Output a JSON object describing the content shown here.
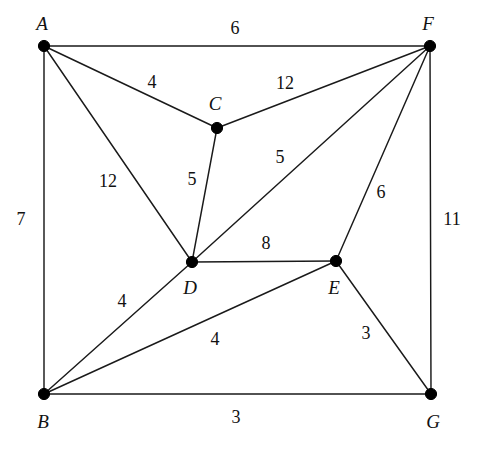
{
  "figure": {
    "type": "weighted-undirected-graph",
    "background_color": "#ffffff",
    "line_color": "#1a1a1a",
    "text_color": "#111111",
    "width": 477,
    "height": 453
  },
  "chart_data": {
    "type": "diagram",
    "title": "",
    "xlabel": "",
    "ylabel": "",
    "grid": false,
    "legend": "none",
    "nodes": [
      {
        "id": "A",
        "label": "A",
        "x": 44,
        "y": 46,
        "label_x": 42,
        "label_y": 26
      },
      {
        "id": "B",
        "label": "B",
        "x": 44,
        "y": 394,
        "label_x": 43,
        "label_y": 424
      },
      {
        "id": "C",
        "label": "C",
        "x": 217,
        "y": 128,
        "label_x": 215,
        "label_y": 106
      },
      {
        "id": "D",
        "label": "D",
        "x": 192,
        "y": 262,
        "label_x": 190,
        "label_y": 290
      },
      {
        "id": "E",
        "label": "E",
        "x": 336,
        "y": 261,
        "label_x": 334,
        "label_y": 290
      },
      {
        "id": "F",
        "label": "F",
        "x": 430,
        "y": 46,
        "label_x": 428,
        "label_y": 26
      },
      {
        "id": "G",
        "label": "G",
        "x": 431,
        "y": 394,
        "label_x": 433,
        "label_y": 424
      }
    ],
    "edges": [
      {
        "source": "A",
        "target": "F",
        "weight": 6,
        "label": "6",
        "label_x": 235,
        "label_y": 30
      },
      {
        "source": "A",
        "target": "C",
        "weight": 4,
        "label": "4",
        "label_x": 152,
        "label_y": 84
      },
      {
        "source": "A",
        "target": "D",
        "weight": 12,
        "label": "12",
        "label_x": 108,
        "label_y": 183
      },
      {
        "source": "A",
        "target": "B",
        "weight": 7,
        "label": "7",
        "label_x": 21,
        "label_y": 221
      },
      {
        "source": "C",
        "target": "F",
        "weight": 12,
        "label": "12",
        "label_x": 285,
        "label_y": 85
      },
      {
        "source": "C",
        "target": "D",
        "weight": 5,
        "label": "5",
        "label_x": 192,
        "label_y": 181
      },
      {
        "source": "D",
        "target": "F",
        "weight": 5,
        "label": "5",
        "label_x": 280,
        "label_y": 159
      },
      {
        "source": "D",
        "target": "E",
        "weight": 8,
        "label": "8",
        "label_x": 266,
        "label_y": 245
      },
      {
        "source": "D",
        "target": "B",
        "weight": 4,
        "label": "4",
        "label_x": 122,
        "label_y": 303
      },
      {
        "source": "E",
        "target": "F",
        "weight": 6,
        "label": "6",
        "label_x": 381,
        "label_y": 194
      },
      {
        "source": "E",
        "target": "B",
        "weight": 4,
        "label": "4",
        "label_x": 215,
        "label_y": 341
      },
      {
        "source": "E",
        "target": "G",
        "weight": 3,
        "label": "3",
        "label_x": 366,
        "label_y": 335
      },
      {
        "source": "F",
        "target": "G",
        "weight": 11,
        "label": "11",
        "label_x": 452,
        "label_y": 221
      },
      {
        "source": "B",
        "target": "G",
        "weight": 3,
        "label": "3",
        "label_x": 236,
        "label_y": 419
      }
    ]
  }
}
